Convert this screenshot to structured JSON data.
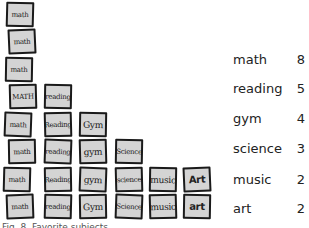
{
  "chart_data": {
    "type": "bar",
    "style": "pictograph",
    "title": "",
    "caption": "Fig. 8. Favorite subjects",
    "categories": [
      "math",
      "reading",
      "gym",
      "science",
      "music",
      "art"
    ],
    "values": [
      8,
      5,
      4,
      3,
      2,
      2
    ],
    "card_labels": {
      "math": [
        "math",
        "math",
        "math",
        "MATH",
        "math",
        "math",
        "math",
        "math"
      ],
      "reading": [
        "reading",
        "Reading",
        "reading",
        "Reading",
        "reading"
      ],
      "gym": [
        "Gym",
        "gym",
        "gym",
        "Gym"
      ],
      "science": [
        "Science",
        "science",
        "Science"
      ],
      "music": [
        "music",
        "music"
      ],
      "art": [
        "Art",
        "art"
      ]
    },
    "legend": [
      {
        "label": "math",
        "value": "8"
      },
      {
        "label": "reading",
        "value": "5"
      },
      {
        "label": "gym",
        "value": "4"
      },
      {
        "label": "science",
        "value": "3"
      },
      {
        "label": "music",
        "value": "2"
      },
      {
        "label": "art",
        "value": "2"
      }
    ],
    "legend_position": "right",
    "colors": {
      "card_fill": "#d4d4d4",
      "card_border": "#1a1a1a",
      "text": "#222222"
    }
  }
}
